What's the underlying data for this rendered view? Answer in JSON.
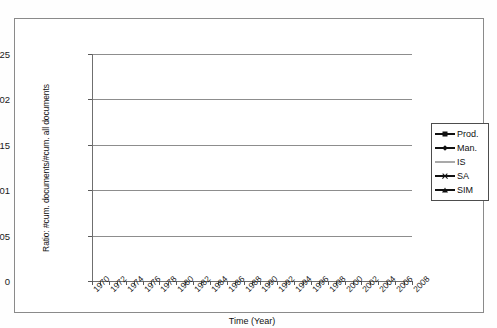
{
  "chart_data": {
    "type": "line",
    "title": "",
    "xlabel": "Time (Year)",
    "ylabel": "Ratio: #cum. documents/#cum. all documents",
    "xlim": [
      1970,
      2008
    ],
    "ylim": [
      0,
      0.025
    ],
    "grid": true,
    "legend_position": "right",
    "y_ticks": [
      "0",
      "0,005",
      "0,01",
      "0,015",
      "0,02",
      "0,025"
    ],
    "y_tick_values": [
      0,
      0.005,
      0.01,
      0.015,
      0.02,
      0.025
    ],
    "x_ticks": [
      "1970",
      "1972",
      "1974",
      "1976",
      "1978",
      "1980",
      "1982",
      "1984",
      "1986",
      "1988",
      "1990",
      "1992",
      "1994",
      "1996",
      "1998",
      "2000",
      "2002",
      "2004",
      "2006",
      "2008"
    ],
    "x": [
      1970,
      1971,
      1972,
      1973,
      1974,
      1975,
      1976,
      1977,
      1978,
      1979,
      1980,
      1981,
      1982,
      1983,
      1984,
      1985,
      1986,
      1987,
      1988,
      1989,
      1990,
      1991,
      1992,
      1993,
      1994,
      1995,
      1996,
      1997,
      1998,
      1999,
      2000,
      2001,
      2002,
      2003,
      2004,
      2005,
      2006,
      2007,
      2008
    ],
    "series": [
      {
        "name": "Prod.",
        "marker": "square",
        "color": "#111111",
        "values": [
          0.0078,
          0.00775,
          0.00773,
          0.00762,
          0.00745,
          0.0074,
          0.00742,
          0.00748,
          0.00755,
          0.00762,
          0.00768,
          0.00775,
          0.00782,
          0.00788,
          0.00792,
          0.00798,
          0.00805,
          0.00812,
          0.0082,
          0.00828,
          0.00832,
          0.00835,
          0.00962,
          0.0108,
          0.01195,
          0.013,
          0.01398,
          0.0149,
          0.0157,
          0.0165,
          0.0173,
          0.018,
          0.01868,
          0.01935,
          0.01998,
          0.02058,
          0.02118,
          0.02178,
          0.02345
        ]
      },
      {
        "name": "Man.",
        "marker": "diamond",
        "color": "#111111",
        "values": [
          0.00432,
          0.00422,
          0.00418,
          0.00415,
          0.00418,
          0.00425,
          0.00435,
          0.00448,
          0.0046,
          0.00472,
          0.00482,
          0.00492,
          0.00505,
          0.00518,
          0.0053,
          0.00542,
          0.00552,
          0.0056,
          0.00568,
          0.00575,
          0.00582,
          0.00588,
          0.0066,
          0.0074,
          0.0082,
          0.00898,
          0.00975,
          0.01055,
          0.01132,
          0.0121,
          0.01288,
          0.01362,
          0.01438,
          0.01512,
          0.0159,
          0.01668,
          0.01748,
          0.01862,
          0.02008
        ]
      },
      {
        "name": "IS",
        "marker": "dash",
        "color": "#a9a9a9",
        "values": [
          0.0001,
          0.0001,
          0.0001,
          0.0001,
          0.00011,
          0.00011,
          0.00011,
          0.00012,
          0.00012,
          0.00012,
          0.00013,
          0.00013,
          0.00013,
          0.00014,
          0.00014,
          0.00015,
          0.00015,
          0.00016,
          0.00016,
          0.00017,
          0.00018,
          0.00028,
          0.00048,
          0.0007,
          0.00092,
          0.00112,
          0.0013,
          0.00148,
          0.00165,
          0.0018,
          0.00196,
          0.0021,
          0.00222,
          0.00235,
          0.00248,
          0.00262,
          0.00278,
          0.00295,
          0.00322
        ]
      },
      {
        "name": "SA",
        "marker": "x",
        "color": "#111111",
        "values": [
          0.00012,
          0.00012,
          0.00012,
          0.00013,
          0.00013,
          0.00013,
          0.00014,
          0.00014,
          0.00015,
          0.00015,
          0.00016,
          0.00016,
          0.00017,
          0.00017,
          0.00018,
          0.00018,
          0.00019,
          0.0002,
          0.00021,
          0.00022,
          0.00024,
          0.00042,
          0.00072,
          0.00102,
          0.00132,
          0.0016,
          0.00188,
          0.00215,
          0.0024,
          0.00262,
          0.00285,
          0.00308,
          0.0033,
          0.00352,
          0.00378,
          0.00405,
          0.00432,
          0.0047,
          0.0052
        ]
      },
      {
        "name": "SIM",
        "marker": "triangle",
        "color": "#111111",
        "values": [
          0.00172,
          0.00168,
          0.00166,
          0.00165,
          0.00166,
          0.00167,
          0.00168,
          0.0017,
          0.00172,
          0.00174,
          0.00176,
          0.00178,
          0.00182,
          0.00186,
          0.0019,
          0.00195,
          0.002,
          0.00205,
          0.0021,
          0.00215,
          0.00222,
          0.00238,
          0.0029,
          0.00345,
          0.00402,
          0.00458,
          0.00512,
          0.00568,
          0.00625,
          0.0068,
          0.00738,
          0.00792,
          0.00848,
          0.00905,
          0.00962,
          0.0102,
          0.01078,
          0.01152,
          0.01272
        ]
      }
    ]
  },
  "legend": {
    "items": [
      {
        "label": "Prod.",
        "marker": "square",
        "color": "#111111"
      },
      {
        "label": "Man.",
        "marker": "diamond",
        "color": "#111111"
      },
      {
        "label": "IS",
        "marker": "dash",
        "color": "#a9a9a9"
      },
      {
        "label": "SA",
        "marker": "x",
        "color": "#111111"
      },
      {
        "label": "SIM",
        "marker": "triangle",
        "color": "#111111"
      }
    ]
  }
}
